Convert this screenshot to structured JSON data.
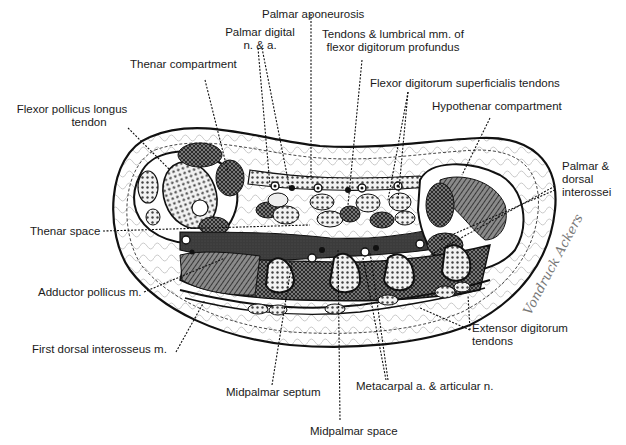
{
  "figure": {
    "labels": {
      "palmar_aponeurosis": "Palmar aponeurosis",
      "palmar_digital_line1": "Palmar digital",
      "palmar_digital_line2": "n. & a.",
      "tendons_lumbrical_line1": "Tendons & lumbrical mm. of",
      "tendons_lumbrical_line2": "flexor digitorum profundus",
      "thenar_compartment": "Thenar compartment",
      "fds_tendons": "Flexor digitorum superficialis tendons",
      "hypothenar_compartment": "Hypothenar compartment",
      "fpl_line1": "Flexor pollicus longus",
      "fpl_line2": "tendon",
      "palmar_dorsal_line1": "Palmar &",
      "palmar_dorsal_line2": "dorsal",
      "palmar_dorsal_line3": "interossei",
      "thenar_space": "Thenar space",
      "adductor_pollicus": "Adductor pollicus m.",
      "first_dorsal_interosseus": "First dorsal interosseus m.",
      "extensor_line1": "Extensor digitorum",
      "extensor_line2": "tendons",
      "midpalmar_septum": "Midpalmar septum",
      "metacarpal": "Metacarpal a. & articular n.",
      "midpalmar_space": "Midpalmar space"
    },
    "signature": "Vondruck Ackers",
    "colors": {
      "ink": "#1a1a1a",
      "dark_space": "#3a3a3a",
      "muscle": "#6a6a6a",
      "paper": "#ffffff"
    }
  }
}
